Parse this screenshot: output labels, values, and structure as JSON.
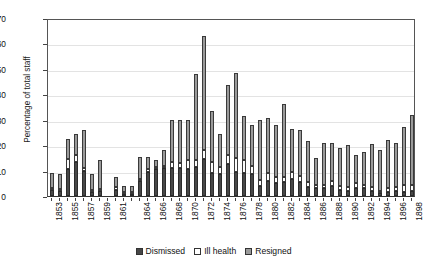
{
  "chart_data": {
    "type": "bar",
    "stacked": true,
    "title": "",
    "subtitle": "",
    "xlabel": "",
    "ylabel": "Percentage of total staff",
    "ylim": [
      0,
      70
    ],
    "ytick_step": 10,
    "yticks": [
      0,
      10,
      20,
      30,
      40,
      50,
      60,
      70
    ],
    "grid": true,
    "legend_position": "bottom",
    "legend": [
      "Dismissed",
      "Ill health",
      "Resigned"
    ],
    "series_colors": {
      "Dismissed": "#474747",
      "Ill health": "#ffffff",
      "Resigned": "#9a9a9a"
    },
    "categories": [
      "1853",
      "1854",
      "1855",
      "1856",
      "1857",
      "1858",
      "1859",
      "1860",
      "1861",
      "1862",
      "1863",
      "1864",
      "1865",
      "1866",
      "1867",
      "1868",
      "1869",
      "1870",
      "1871",
      "1872",
      "1873",
      "1874",
      "1875",
      "1876",
      "1877",
      "1878",
      "1879",
      "1880",
      "1881",
      "1882",
      "1883",
      "1884",
      "1885",
      "1886",
      "1887",
      "1888",
      "1889",
      "1890",
      "1891",
      "1892",
      "1893",
      "1894",
      "1895",
      "1896",
      "1897",
      "1898"
    ],
    "tick_labels_shown": [
      "1853",
      "1855",
      "1857",
      "1859",
      "1861",
      "1864",
      "1866",
      "1868",
      "1870",
      "1872",
      "1874",
      "1876",
      "1878",
      "1880",
      "1882",
      "1884",
      "1886",
      "1888",
      "1890",
      "1892",
      "1894",
      "1896",
      "1898"
    ],
    "series": [
      {
        "name": "Dismissed",
        "values": [
          2.5,
          2.0,
          10.5,
          13.5,
          10.0,
          1.5,
          2.0,
          0.0,
          2.5,
          1.0,
          1.0,
          6.0,
          9.5,
          10.5,
          11.0,
          11.0,
          11.0,
          10.5,
          11.5,
          14.5,
          9.0,
          8.5,
          12.5,
          9.5,
          9.0,
          8.5,
          4.0,
          6.0,
          5.0,
          5.5,
          6.5,
          5.5,
          3.5,
          3.0,
          3.0,
          4.0,
          2.5,
          2.0,
          3.0,
          3.0,
          2.0,
          1.0,
          1.5,
          2.0,
          1.5,
          2.0
        ]
      },
      {
        "name": "Ill health",
        "values": [
          0.5,
          0.5,
          4.0,
          2.5,
          1.0,
          0.5,
          0.5,
          0.0,
          1.0,
          0.5,
          0.5,
          0.5,
          1.0,
          1.0,
          1.0,
          2.5,
          2.0,
          3.5,
          2.5,
          3.5,
          4.5,
          3.0,
          3.5,
          5.5,
          5.0,
          3.5,
          2.5,
          3.0,
          2.5,
          2.0,
          3.0,
          2.5,
          2.0,
          1.5,
          1.5,
          2.0,
          1.5,
          1.5,
          2.0,
          1.5,
          1.5,
          1.0,
          1.5,
          1.5,
          3.0,
          2.5
        ]
      },
      {
        "name": "Resigned",
        "values": [
          6.0,
          6.0,
          8.0,
          8.5,
          15.0,
          6.5,
          11.5,
          0.0,
          4.0,
          2.5,
          2.5,
          9.0,
          5.0,
          2.5,
          6.0,
          16.5,
          17.0,
          16.0,
          34.0,
          45.0,
          20.0,
          13.0,
          27.5,
          33.5,
          17.5,
          16.0,
          23.5,
          21.5,
          20.5,
          28.5,
          17.0,
          18.0,
          16.0,
          10.5,
          16.5,
          15.0,
          15.0,
          16.5,
          11.0,
          13.0,
          17.0,
          16.0,
          19.0,
          17.5,
          22.5,
          27.5
        ]
      }
    ]
  },
  "legend": {
    "items": [
      {
        "label": "Dismissed"
      },
      {
        "label": "Ill health"
      },
      {
        "label": "Resigned"
      }
    ]
  },
  "axes": {
    "y_title": "Percentage of total staff"
  }
}
